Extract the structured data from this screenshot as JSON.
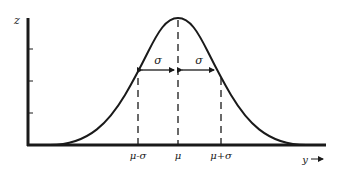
{
  "diagram": {
    "y_axis_label": "z",
    "x_axis_label": "y",
    "x_axis_arrow": "→",
    "x_ticks": [
      {
        "label": "μ-σ",
        "x": 138
      },
      {
        "label": "μ",
        "x": 178
      },
      {
        "label": "μ+σ",
        "x": 221
      }
    ],
    "sigma_labels": [
      {
        "label": "σ",
        "side": "left"
      },
      {
        "label": "σ",
        "side": "right"
      }
    ],
    "colors": {
      "ink": "#1a1a1a",
      "background": "#ffffff"
    }
  }
}
